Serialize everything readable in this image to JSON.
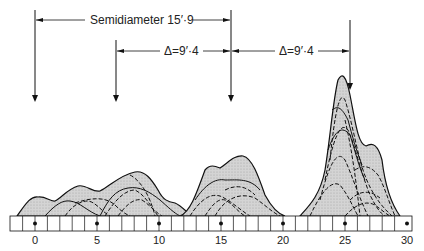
{
  "annotations": {
    "semidiameter": "Semidiameter  15′·9",
    "delta_left": "Δ=9′·4",
    "delta_right": "Δ=9′·4"
  },
  "scale": {
    "ticks": [
      "0",
      "5",
      "10",
      "15",
      "20",
      "25",
      "30"
    ]
  },
  "colors": {
    "fill": "#cfcfcf",
    "line": "#111111"
  }
}
